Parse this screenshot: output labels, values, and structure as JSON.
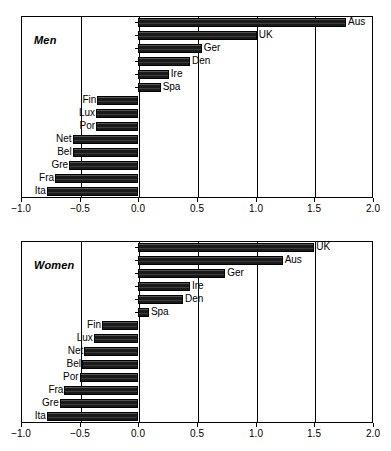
{
  "figure": {
    "top_cut_text": "",
    "background_color": "#ffffff",
    "bar_color": "#1a1a1a",
    "axis_color": "#000000"
  },
  "axis": {
    "tick_labels": [
      "-1.0",
      "-0.5",
      "0.0",
      "0.5",
      "1.0",
      "1.5",
      "2.0"
    ],
    "tick_values": [
      -1.0,
      -0.5,
      0.0,
      0.5,
      1.0,
      1.5,
      2.0
    ],
    "xmin": -1.0,
    "xmax": 2.0
  },
  "panels": [
    {
      "id": "men",
      "label": "Men"
    },
    {
      "id": "women",
      "label": "Women"
    }
  ],
  "chart_data": [
    {
      "type": "bar",
      "orientation": "horizontal",
      "title": "Men",
      "xlabel": "",
      "ylabel": "",
      "xlim": [
        -1.0,
        2.0
      ],
      "grid": true,
      "grid_axis": "x",
      "legend": "none",
      "categories": [
        "Aus",
        "UK",
        "Ger",
        "Den",
        "Ire",
        "Spa",
        "Fin",
        "Lux",
        "Por",
        "Net",
        "Bel",
        "Gre",
        "Fra",
        "Ita"
      ],
      "values": [
        1.77,
        1.01,
        0.54,
        0.44,
        0.26,
        0.19,
        -0.35,
        -0.36,
        -0.36,
        -0.56,
        -0.56,
        -0.59,
        -0.71,
        -0.78
      ]
    },
    {
      "type": "bar",
      "orientation": "horizontal",
      "title": "Women",
      "xlabel": "",
      "ylabel": "",
      "xlim": [
        -1.0,
        2.0
      ],
      "grid": true,
      "grid_axis": "x",
      "legend": "none",
      "categories": [
        "UK",
        "Aus",
        "Ger",
        "Ire",
        "Den",
        "Spa",
        "Fin",
        "Lux",
        "Net",
        "Bel",
        "Por",
        "Fra",
        "Gre",
        "Ita"
      ],
      "values": [
        1.5,
        1.23,
        0.74,
        0.44,
        0.38,
        0.09,
        -0.31,
        -0.38,
        -0.46,
        -0.48,
        -0.5,
        -0.63,
        -0.67,
        -0.78
      ]
    }
  ]
}
